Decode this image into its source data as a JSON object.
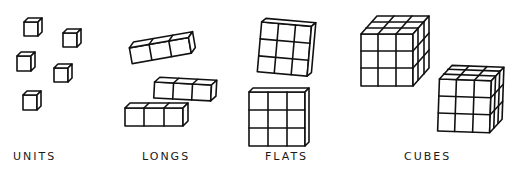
{
  "diagram": {
    "groups": [
      {
        "id": "units",
        "label": "UNITS",
        "count": 5,
        "description": "single small cubes"
      },
      {
        "id": "longs",
        "label": "LONGS",
        "count": 3,
        "description": "rods of 3 cubes"
      },
      {
        "id": "flats",
        "label": "FLATS",
        "count": 2,
        "description": "3x3 flat squares"
      },
      {
        "id": "cubes",
        "label": "CUBES",
        "count": 2,
        "description": "3x3x3 cubes"
      }
    ],
    "line_color": "#111111",
    "background": "#ffffff"
  }
}
